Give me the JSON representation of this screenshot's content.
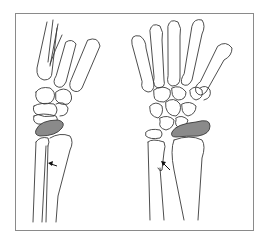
{
  "figure": {
    "type": "medical line illustration",
    "views": [
      {
        "id": "lateral",
        "label": "lateral view of wrist and forearm"
      },
      {
        "id": "posteroanterior",
        "label": "posteroanterior view of hand, wrist and forearm"
      }
    ],
    "highlight_color": "#8a8a8a",
    "highlighted_structure": "lunate / proximal carpal (shaded)",
    "annotations": [
      {
        "type": "arrow",
        "view": "lateral",
        "points_to": "distal ulna"
      },
      {
        "type": "arrow",
        "view": "posteroanterior",
        "points_to": "distal ulna"
      }
    ]
  }
}
